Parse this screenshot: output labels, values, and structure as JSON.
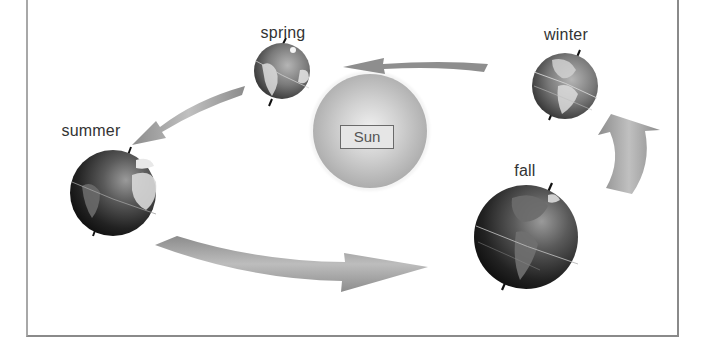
{
  "diagram": {
    "center_body": {
      "label": "Sun",
      "color": "#b8b8b8"
    },
    "seasons": [
      {
        "id": "spring",
        "label": "spring"
      },
      {
        "id": "summer",
        "label": "summer"
      },
      {
        "id": "fall",
        "label": "fall"
      },
      {
        "id": "winter",
        "label": "winter"
      }
    ],
    "arrows": [
      {
        "from": "winter",
        "to": "spring"
      },
      {
        "from": "spring",
        "to": "summer"
      },
      {
        "from": "summer",
        "to": "fall"
      },
      {
        "from": "fall",
        "to": "winter"
      }
    ],
    "icons": {
      "globe": "earth-globe-icon",
      "arrow": "curved-arrow-icon"
    },
    "colors": {
      "arrow": "#9a9a9a",
      "globe_dark": "#1a1a1a",
      "globe_land": "#d8d8d8",
      "frame": "#8a8a8a",
      "label_text": "#333333"
    }
  }
}
